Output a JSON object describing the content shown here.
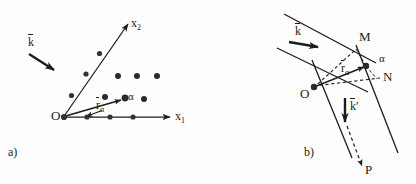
{
  "figure": {
    "panels": [
      {
        "id": "a",
        "label": "a)",
        "description": "crystal lattice with incident wave vector and position vector",
        "axes": [
          {
            "name": "x2",
            "label_base": "x",
            "label_sub": "2"
          },
          {
            "name": "x1",
            "label_base": "x",
            "label_sub": "1"
          }
        ],
        "points": [
          {
            "name": "origin",
            "label": "O"
          },
          {
            "name": "atom-alpha",
            "label": "α"
          }
        ],
        "vectors": [
          {
            "name": "k-vector",
            "label_base": "k",
            "label_sub": "",
            "overbar": true
          },
          {
            "name": "r-alpha-vector",
            "label_base": "r",
            "label_sub": "α",
            "overbar": true
          }
        ]
      },
      {
        "id": "b",
        "label": "b)",
        "description": "path difference construction between lattice planes",
        "points": [
          {
            "name": "origin",
            "label": "O"
          },
          {
            "name": "point-m",
            "label": "M"
          },
          {
            "name": "point-n",
            "label": "N"
          },
          {
            "name": "atom-alpha",
            "label": "α"
          },
          {
            "name": "point-p",
            "label": "P"
          }
        ],
        "vectors": [
          {
            "name": "k-vector",
            "label_base": "k",
            "label_sub": "",
            "overbar": true,
            "prime": ""
          },
          {
            "name": "k-prime-vector",
            "label_base": "k",
            "label_sub": "",
            "overbar": true,
            "prime": "′"
          },
          {
            "name": "r-alpha-vector",
            "label_base": "r",
            "label_sub": "α",
            "overbar": true
          }
        ]
      }
    ],
    "colors": {
      "ink": "#1c1c1c",
      "line": "#2a2a2a",
      "background": "#fefefe",
      "dot_fill": "#333333"
    }
  }
}
